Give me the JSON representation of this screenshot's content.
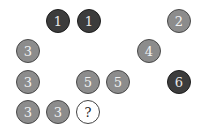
{
  "puzzle": {
    "colors": {
      "dark": "#3c3c3c",
      "grey": "#8c8c8c",
      "blank": "#ffffff"
    },
    "circles": [
      {
        "label": "1",
        "style": "dark",
        "cx": 58,
        "cy": 21
      },
      {
        "label": "1",
        "style": "dark",
        "cx": 89,
        "cy": 21
      },
      {
        "label": "2",
        "style": "grey",
        "cx": 179,
        "cy": 21
      },
      {
        "label": "3",
        "style": "grey",
        "cx": 28,
        "cy": 51
      },
      {
        "label": "4",
        "style": "grey",
        "cx": 149,
        "cy": 51
      },
      {
        "label": "3",
        "style": "grey",
        "cx": 28,
        "cy": 82
      },
      {
        "label": "5",
        "style": "grey",
        "cx": 88,
        "cy": 82
      },
      {
        "label": "5",
        "style": "grey",
        "cx": 118,
        "cy": 82
      },
      {
        "label": "6",
        "style": "dark",
        "cx": 179,
        "cy": 82
      },
      {
        "label": "3",
        "style": "grey",
        "cx": 28,
        "cy": 112
      },
      {
        "label": "3",
        "style": "grey",
        "cx": 58,
        "cy": 112
      },
      {
        "label": "?",
        "style": "blank",
        "cx": 88,
        "cy": 112
      }
    ]
  }
}
